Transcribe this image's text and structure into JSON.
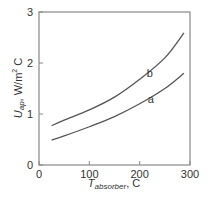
{
  "chart_data": {
    "type": "line",
    "title": "",
    "xlabel": "T_absorber, C",
    "xlabel_main": "T",
    "xlabel_sub": "absorber",
    "xlabel_unit": ", C",
    "ylabel": "U_ap, W/m^2 C",
    "ylabel_main": "U",
    "ylabel_sub": "ap",
    "ylabel_unit": ", W/m",
    "ylabel_sup": "2",
    "ylabel_tail": " C",
    "xlim": [
      0,
      300
    ],
    "ylim": [
      0,
      3
    ],
    "xticks": [
      0,
      100,
      200,
      300
    ],
    "yticks": [
      0,
      1,
      2,
      3
    ],
    "xtick_labels": [
      "0",
      "100",
      "200",
      "300"
    ],
    "ytick_labels": [
      "0",
      "1",
      "2",
      "3"
    ],
    "grid": false,
    "legend": "inline labels",
    "series": [
      {
        "name": "a",
        "x": [
          25,
          50,
          100,
          150,
          200,
          250,
          288
        ],
        "values": [
          0.49,
          0.57,
          0.75,
          0.95,
          1.2,
          1.5,
          1.8
        ]
      },
      {
        "name": "b",
        "x": [
          25,
          50,
          100,
          150,
          200,
          250,
          288
        ],
        "values": [
          0.77,
          0.88,
          1.08,
          1.33,
          1.68,
          2.1,
          2.59
        ]
      }
    ],
    "annotations": [
      {
        "text": "a",
        "x": 222,
        "y": 1.22
      },
      {
        "text": "b",
        "x": 220,
        "y": 1.72
      }
    ]
  },
  "colors": {
    "line": "#555555",
    "frame": "#888888",
    "text": "#333333"
  }
}
